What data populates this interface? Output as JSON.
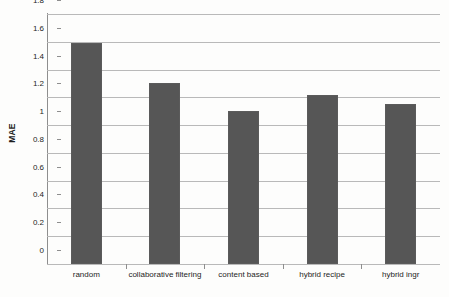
{
  "chart_data": {
    "type": "bar",
    "title": "",
    "xlabel": "",
    "ylabel": "MAE",
    "categories": [
      "random",
      "collaborative filtering",
      "content based",
      "hybrid recipe",
      "hybrid ingr"
    ],
    "values": [
      1.59,
      1.3,
      1.1,
      1.22,
      1.15
    ],
    "ylim": [
      0,
      1.8
    ],
    "yticks": [
      0,
      0.2,
      0.4,
      0.6,
      0.8,
      1,
      1.2,
      1.4,
      1.6,
      1.8
    ],
    "ytick_labels": [
      "0",
      "0.2",
      "0.4",
      "0.6",
      "0.8",
      "1",
      "1.2",
      "1.4",
      "1.6",
      "1.8"
    ],
    "grid": true,
    "legend": "none",
    "series": [
      {
        "name": "MAE",
        "color": "#565656",
        "values": [
          1.59,
          1.3,
          1.1,
          1.22,
          1.15
        ]
      }
    ]
  },
  "colors": {
    "bar": "#565656",
    "gridline": "#b9b9b9",
    "axis": "#8e8e8e",
    "text": "#1d1d1d",
    "background": "#fdfdfc"
  }
}
